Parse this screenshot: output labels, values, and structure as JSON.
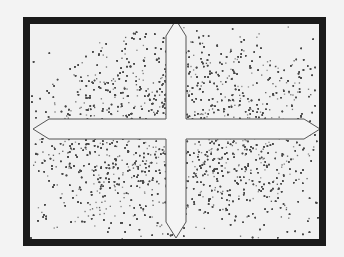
{
  "figure": {
    "colors": {
      "background": "#f3f3f3",
      "frame": "#1a1a1a",
      "stipple": "#4a4a4a",
      "cross_fill": "#f4f4f4",
      "cross_stroke": "#555555"
    },
    "frame": {
      "x": 23,
      "y": 17,
      "width": 303,
      "height": 229,
      "border": 7
    },
    "cross": {
      "center": [
        176,
        129
      ],
      "arm_width": 20,
      "top_tip_y": 20,
      "bottom_tip_y": 238,
      "left_tip_x": 33,
      "right_tip_x": 320
    },
    "regions": [
      {
        "name": "upper-left-blob",
        "cx": 110,
        "cy": 110,
        "density": "high"
      },
      {
        "name": "upper-right-blob",
        "cx": 250,
        "cy": 100,
        "density": "high"
      },
      {
        "name": "lower-left-blob",
        "cx": 100,
        "cy": 175,
        "density": "high"
      },
      {
        "name": "lower-right-blob",
        "cx": 245,
        "cy": 180,
        "density": "high"
      }
    ]
  }
}
